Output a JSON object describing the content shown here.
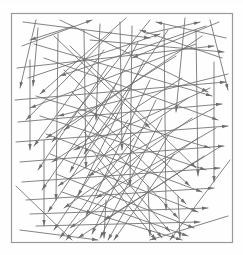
{
  "figure": {
    "kind": "scanned-line-diagram",
    "canvas": {
      "width": 243,
      "height": 255
    },
    "background_color": "#fefefe",
    "frame": {
      "name": "bounding-square",
      "x": 11,
      "y": 13,
      "width": 221,
      "height": 229,
      "stroke_color": "#9a9a9a",
      "stroke_width": 1.2,
      "fill": "none"
    },
    "segment_style": {
      "stroke_color": "#6e6e6e",
      "stroke_width": 0.85,
      "arrowhead": "filled-triangle",
      "arrowhead_length": 6,
      "arrowhead_width": 3.4
    },
    "segments": [
      [
        23,
        22,
        150,
        38
      ],
      [
        206,
        26,
        60,
        76
      ],
      [
        38,
        28,
        33,
        86
      ],
      [
        54,
        36,
        150,
        128
      ],
      [
        100,
        24,
        96,
        120
      ],
      [
        185,
        18,
        176,
        112
      ],
      [
        219,
        22,
        132,
        58
      ],
      [
        17,
        68,
        214,
        46
      ],
      [
        34,
        44,
        212,
        96
      ],
      [
        60,
        20,
        208,
        92
      ],
      [
        126,
        18,
        40,
        94
      ],
      [
        150,
        20,
        52,
        142
      ],
      [
        90,
        40,
        224,
        52
      ],
      [
        28,
        78,
        160,
        34
      ],
      [
        202,
        36,
        64,
        130
      ],
      [
        222,
        58,
        140,
        30
      ],
      [
        15,
        100,
        226,
        82
      ],
      [
        44,
        58,
        218,
        120
      ],
      [
        70,
        46,
        196,
        168
      ],
      [
        112,
        32,
        26,
        120
      ],
      [
        168,
        30,
        84,
        154
      ],
      [
        196,
        44,
        30,
        108
      ],
      [
        228,
        74,
        58,
        116
      ],
      [
        18,
        122,
        222,
        104
      ],
      [
        36,
        96,
        210,
        148
      ],
      [
        64,
        70,
        190,
        186
      ],
      [
        104,
        50,
        34,
        146
      ],
      [
        138,
        42,
        70,
        172
      ],
      [
        176,
        56,
        46,
        138
      ],
      [
        210,
        88,
        74,
        150
      ],
      [
        16,
        142,
        228,
        126
      ],
      [
        40,
        116,
        206,
        170
      ],
      [
        72,
        92,
        186,
        204
      ],
      [
        108,
        66,
        38,
        170
      ],
      [
        144,
        60,
        78,
        196
      ],
      [
        182,
        78,
        52,
        162
      ],
      [
        214,
        108,
        88,
        176
      ],
      [
        20,
        162,
        224,
        146
      ],
      [
        46,
        134,
        202,
        192
      ],
      [
        78,
        112,
        178,
        218
      ],
      [
        116,
        84,
        42,
        190
      ],
      [
        150,
        80,
        86,
        216
      ],
      [
        188,
        98,
        58,
        186
      ],
      [
        216,
        128,
        96,
        198
      ],
      [
        22,
        182,
        220,
        168
      ],
      [
        50,
        154,
        198,
        212
      ],
      [
        84,
        132,
        170,
        232
      ],
      [
        122,
        102,
        48,
        212
      ],
      [
        156,
        100,
        92,
        234
      ],
      [
        192,
        118,
        64,
        208
      ],
      [
        218,
        148,
        104,
        220
      ],
      [
        26,
        200,
        214,
        188
      ],
      [
        56,
        174,
        194,
        228
      ],
      [
        92,
        150,
        162,
        238
      ],
      [
        128,
        120,
        54,
        230
      ],
      [
        162,
        118,
        100,
        238
      ],
      [
        198,
        138,
        70,
        228
      ],
      [
        30,
        214,
        208,
        208
      ],
      [
        62,
        192,
        188,
        236
      ],
      [
        98,
        168,
        156,
        240
      ],
      [
        134,
        138,
        60,
        238
      ],
      [
        168,
        136,
        108,
        240
      ],
      [
        204,
        156,
        78,
        238
      ],
      [
        36,
        226,
        200,
        222
      ],
      [
        68,
        206,
        182,
        240
      ],
      [
        140,
        156,
        66,
        240
      ],
      [
        174,
        154,
        114,
        240
      ],
      [
        120,
        22,
        122,
        150
      ],
      [
        132,
        26,
        130,
        186
      ],
      [
        164,
        24,
        166,
        210
      ],
      [
        84,
        30,
        86,
        168
      ],
      [
        58,
        34,
        56,
        200
      ],
      [
        196,
        30,
        198,
        176
      ],
      [
        44,
        140,
        44,
        226
      ],
      [
        214,
        62,
        214,
        182
      ],
      [
        30,
        60,
        30,
        150
      ],
      [
        106,
        200,
        104,
        238
      ],
      [
        148,
        186,
        150,
        236
      ],
      [
        178,
        196,
        180,
        238
      ],
      [
        22,
        46,
        92,
        20
      ],
      [
        226,
        38,
        156,
        22
      ],
      [
        20,
        230,
        98,
        240
      ],
      [
        228,
        216,
        150,
        240
      ],
      [
        16,
        186,
        72,
        240
      ],
      [
        230,
        160,
        170,
        240
      ],
      [
        36,
        20,
        20,
        88
      ],
      [
        210,
        20,
        228,
        90
      ],
      [
        146,
        34,
        200,
        22
      ],
      [
        74,
        26,
        30,
        40
      ]
    ]
  }
}
